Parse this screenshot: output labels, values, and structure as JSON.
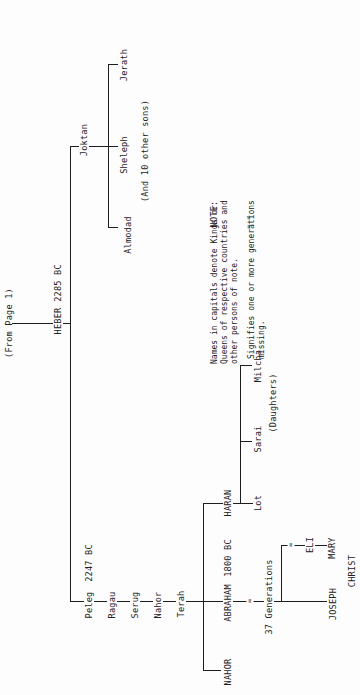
{
  "document": {
    "type": "genealogy-chart",
    "orientation": "rotated-90-ccw",
    "continuation_label": "(From Page 1)"
  },
  "root": {
    "name": "HEBER",
    "date": "2285 BC"
  },
  "joktan_branch": {
    "name": "Joktan",
    "children": [
      "Almodad",
      "Sheleph",
      "Jerath"
    ],
    "note": "(And 10 other sons)"
  },
  "peleg_line": {
    "people": [
      {
        "name": "Peleg",
        "date": "2247 BC"
      },
      {
        "name": "Ragau"
      },
      {
        "name": "Serug"
      },
      {
        "name": "Nahor"
      },
      {
        "name": "Terah"
      }
    ]
  },
  "terah_children": {
    "abraham": {
      "name": "ABRAHAM",
      "date": "1800 BC"
    },
    "haran": {
      "name": "HARAN"
    },
    "nahor": {
      "name": "NAHOR"
    }
  },
  "haran_children": {
    "son": "Lot",
    "daughters": [
      "Sarai",
      "Milcha"
    ],
    "daughters_label": "(Daughters)"
  },
  "abraham_descendants": {
    "gap_label": "37 Generations",
    "joseph": "JOSEPH",
    "eli": "ELI",
    "mary": "MARY",
    "christ": "CHRIST"
  },
  "legend": {
    "note_label": "NOTE:",
    "note_text": "Names in capitals denote Kings or\nQueens of respective countries and\nother persons of note.",
    "missing_symbol": "= =",
    "missing_text": "Signifies one or more generations\nmissing."
  },
  "colors": {
    "ink": "#1e1e1e",
    "paper": "#fdfdfd"
  }
}
